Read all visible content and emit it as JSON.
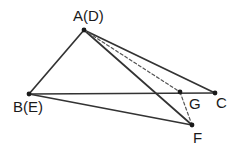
{
  "figure": {
    "stroke_color": "#333333",
    "dash_color": "#555555",
    "point_color": "#1a1a1a",
    "background_color": "#ffffff",
    "solid_stroke_width": 1.7,
    "dashed_stroke_width": 1.2,
    "dash_pattern": "3,2.4",
    "point_radius": 2.4,
    "width": 240,
    "height": 156,
    "points": [
      {
        "id": "A",
        "label": "A(D)",
        "x": 84,
        "y": 30
      },
      {
        "id": "B",
        "label": "B(E)",
        "x": 29,
        "y": 94
      },
      {
        "id": "C",
        "label": "C",
        "x": 215,
        "y": 93
      },
      {
        "id": "G",
        "label": "G",
        "x": 180,
        "y": 92
      },
      {
        "id": "F",
        "label": "F",
        "x": 192,
        "y": 125
      }
    ],
    "segments": [
      {
        "id": "AB",
        "from": "A",
        "to": "B",
        "style": "solid"
      },
      {
        "id": "AC",
        "from": "A",
        "to": "C",
        "style": "solid"
      },
      {
        "id": "AF",
        "from": "A",
        "to": "F",
        "style": "solid"
      },
      {
        "id": "BC",
        "from": "B",
        "to": "C",
        "style": "solid"
      },
      {
        "id": "BF",
        "from": "B",
        "to": "F",
        "style": "solid"
      },
      {
        "id": "AG",
        "from": "A",
        "to": "G",
        "style": "dashed"
      },
      {
        "id": "GF",
        "from": "G",
        "to": "F",
        "style": "dashed"
      }
    ],
    "labels": {
      "A": "A(D)",
      "B": "B(E)",
      "C": "C",
      "G": "G",
      "F": "F"
    }
  }
}
